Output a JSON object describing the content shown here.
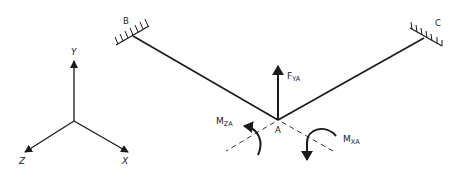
{
  "diagram": {
    "type": "structural-free-body",
    "axes": {
      "y_label": "Y",
      "z_label": "Z",
      "x_label": "X"
    },
    "supports": [
      {
        "id": "B",
        "label": "B",
        "type": "fixed"
      },
      {
        "id": "C",
        "label": "C",
        "type": "fixed"
      }
    ],
    "joint": {
      "label": "A"
    },
    "force": {
      "main": "F",
      "sub": "YA"
    },
    "moments": [
      {
        "id": "mza",
        "main": "M",
        "sub": "ZA"
      },
      {
        "id": "mxa",
        "main": "M",
        "sub": "XA"
      }
    ],
    "colors": {
      "stroke": "#1a1a1a",
      "background": "#ffffff"
    }
  }
}
